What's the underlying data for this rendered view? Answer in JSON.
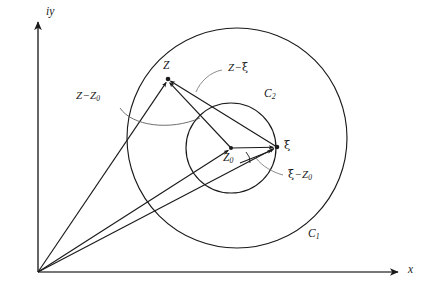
{
  "figure": {
    "colors": {
      "stroke": "#1a1a1a",
      "background": "#ffffff",
      "label": "#1a1a1a"
    },
    "axes": {
      "vertical_label": "iy",
      "horizontal_label": "x",
      "origin": {
        "x": 38,
        "y": 272
      }
    },
    "circles": [
      {
        "name": "C1",
        "label": "C",
        "subscript": "1",
        "cx": 237,
        "cy": 138,
        "r": 110
      },
      {
        "name": "C2",
        "label": "C",
        "subscript": "2",
        "cx": 231,
        "cy": 148,
        "r": 45
      }
    ],
    "points": [
      {
        "name": "Z",
        "label": "Z",
        "subscript": "",
        "x": 168,
        "y": 79
      },
      {
        "name": "Z0",
        "label": "Z",
        "subscript": "0",
        "x": 231,
        "y": 148
      },
      {
        "name": "xi",
        "label": "ξ",
        "subscript": "",
        "x": 277,
        "y": 147
      }
    ],
    "vectors": [
      {
        "name": "origin-to-Z",
        "label": ""
      },
      {
        "name": "origin-to-Z0",
        "label": ""
      },
      {
        "name": "origin-to-xi",
        "label": ""
      },
      {
        "name": "Z0-to-Z",
        "label_parts": [
          "Z",
          "−",
          "Z",
          "0"
        ],
        "label_text": "Z − Z0"
      },
      {
        "name": "Z0-to-xi",
        "label_parts": [
          "ξ",
          "−",
          "Z",
          "0"
        ],
        "label_text": "ξ − Z0"
      },
      {
        "name": "xi-to-Z",
        "label_parts": [
          "Z",
          "−",
          "ξ"
        ],
        "label_text": "Z − ξ"
      }
    ],
    "labels": {
      "iy": "iy",
      "x": "x",
      "Z": "Z",
      "Z0_base": "Z",
      "Z0_sub": "0",
      "xi": "ξ",
      "C1_base": "C",
      "C1_sub": "1",
      "C2_base": "C",
      "C2_sub": "2",
      "minus": "−"
    }
  }
}
